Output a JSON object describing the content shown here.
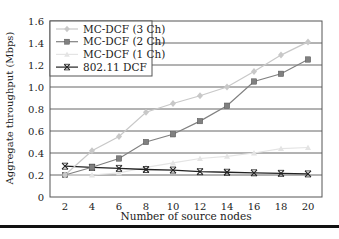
{
  "chart_data": {
    "type": "line",
    "title": "",
    "xlabel": "Number of source nodes",
    "ylabel": "Aggregate throughput (Mbps)",
    "x": [
      2,
      4,
      6,
      8,
      10,
      12,
      14,
      16,
      18,
      20
    ],
    "xticks": [
      "2",
      "4",
      "6",
      "8",
      "10",
      "12",
      "14",
      "16",
      "18",
      "20"
    ],
    "yticks": [
      "0",
      "0.2",
      "0.4",
      "0.6",
      "0.8",
      "1.0",
      "1.2",
      "1.4",
      "1.6"
    ],
    "ylim": [
      0,
      1.6
    ],
    "xlim": [
      1,
      21
    ],
    "grid": "horizontal",
    "legend_position": "upper left",
    "series": [
      {
        "name": "MC-DCF (3 Ch)",
        "marker": "diamond",
        "color": "#c8c8c8",
        "values": [
          0.2,
          0.42,
          0.55,
          0.77,
          0.85,
          0.92,
          1.0,
          1.14,
          1.29,
          1.41
        ]
      },
      {
        "name": "MC-DCF (2 Ch)",
        "marker": "square",
        "color": "#808080",
        "values": [
          0.2,
          0.27,
          0.35,
          0.5,
          0.57,
          0.69,
          0.83,
          1.05,
          1.12,
          1.25
        ]
      },
      {
        "name": "MC-DCF (1 Ch)",
        "marker": "triangle",
        "color": "#e4e4e4",
        "values": [
          0.2,
          0.2,
          0.22,
          0.27,
          0.31,
          0.35,
          0.37,
          0.4,
          0.44,
          0.45
        ]
      },
      {
        "name": "802.11 DCF",
        "marker": "x",
        "color": "#222222",
        "values": [
          0.28,
          0.27,
          0.26,
          0.25,
          0.245,
          0.23,
          0.225,
          0.22,
          0.215,
          0.21
        ]
      }
    ]
  }
}
